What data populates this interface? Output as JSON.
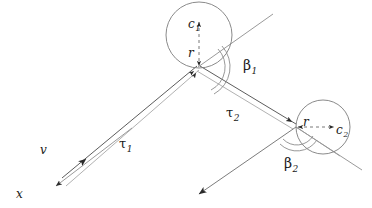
{
  "figure": {
    "kind": "geometry-diagram",
    "caption": "",
    "width": 372,
    "height": 208,
    "background_color": "#ffffff",
    "colors": {
      "dark_line": "#2b2b2b",
      "gray_line": "#9a9a9a",
      "circle_stroke": "#7d7d7d",
      "arc_stroke": "#8c8c8c",
      "text": "#1a1a1a"
    }
  },
  "labels": {
    "c1": {
      "base": "c",
      "sub": "1"
    },
    "c2": {
      "base": "c",
      "sub": "2"
    },
    "r1": {
      "base": "r",
      "sub": ""
    },
    "r2": {
      "base": "r",
      "sub": ""
    },
    "beta1": {
      "base": "β",
      "sub": "1"
    },
    "beta2": {
      "base": "β",
      "sub": "2"
    },
    "tau1": {
      "base": "τ",
      "sub": "1"
    },
    "tau2": {
      "base": "τ",
      "sub": "2"
    },
    "v": {
      "base": "v",
      "sub": ""
    },
    "x": {
      "base": "x",
      "sub": ""
    }
  },
  "geometry": {
    "circle1": {
      "cx": 199,
      "cy": 35,
      "r": 33,
      "center_label": "c1",
      "radius_label": "r"
    },
    "circle2": {
      "cx": 323,
      "cy": 127,
      "r": 27,
      "center_label": "c2",
      "radius_label": "r"
    },
    "vertex1": {
      "x": 198,
      "y": 67
    },
    "vertex2": {
      "x": 296,
      "y": 127
    },
    "tau1_segment": {
      "x1": 60,
      "y1": 182,
      "x2": 198,
      "y2": 67
    },
    "tau2_segment": {
      "x1": 198,
      "y1": 67,
      "x2": 296,
      "y2": 127
    },
    "tangent1_ray": {
      "x1": 198,
      "y1": 67,
      "x2": 273,
      "y2": 14
    },
    "tangent2_ray": {
      "x1": 296,
      "y1": 127,
      "x2": 362,
      "y2": 170
    },
    "exit_ray": {
      "x1": 296,
      "y1": 127,
      "x2": 196,
      "y2": 196
    },
    "x_axis_arrow": {
      "x1": 130,
      "y1": 129,
      "x2": 52,
      "y2": 188
    },
    "v_arrow_direction": "up-right",
    "x_arrow_direction": "down-left",
    "beta1_arc_radius": [
      26,
      31
    ],
    "beta2_arc_radius": [
      18,
      23
    ]
  }
}
